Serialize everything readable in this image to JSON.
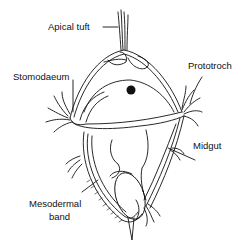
{
  "diagram": {
    "labels": {
      "apical_tuft": "Apical tuft",
      "stomodaeum": "Stomodaeum",
      "prototroch": "Prototroch",
      "midgut": "Midgut",
      "mesodermal_band_line1": "Mesodermal",
      "mesodermal_band_line2": "band"
    },
    "colors": {
      "ink": "#111111",
      "background": "#ffffff"
    }
  }
}
